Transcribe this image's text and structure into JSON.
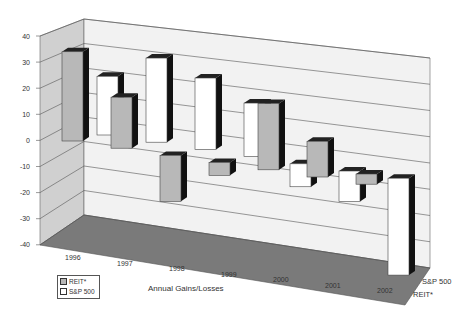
{
  "chart_data": {
    "type": "bar",
    "style": "3d-clustered",
    "title": "",
    "xlabel": "Annual Gains/Losses",
    "ylabel": "",
    "categories": [
      "1996",
      "1997",
      "1998",
      "1999",
      "2000",
      "2001",
      "2002"
    ],
    "series": [
      {
        "name": "REIT*",
        "color": "#b8b8b8",
        "values": [
          35,
          20,
          -18,
          -5,
          26,
          14,
          4
        ]
      },
      {
        "name": "S&P 500",
        "color": "#ffffff",
        "values": [
          23,
          33,
          28,
          21,
          -9,
          -12,
          -38
        ]
      }
    ],
    "y_ticks": [
      40,
      30,
      20,
      10,
      0,
      -10,
      -20,
      -30,
      -40
    ],
    "ylim": [
      -40,
      40
    ],
    "depth_labels": [
      "S&P 500",
      "REIT*"
    ],
    "legend": {
      "position": "bottom-left",
      "entries": [
        "REIT*",
        "S&P 500"
      ]
    },
    "grid": true
  }
}
